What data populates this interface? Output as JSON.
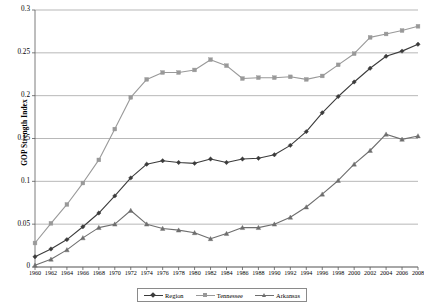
{
  "chart_data": {
    "type": "line",
    "title": "",
    "xlabel": "",
    "ylabel": "GOP Strength Index",
    "ylim": [
      0,
      0.3
    ],
    "ytick_labels": [
      "0",
      "0.05",
      "0.1",
      "0.15",
      "0.2",
      "0.25",
      "0.3"
    ],
    "ytick_values": [
      0,
      0.05,
      0.1,
      0.15,
      0.2,
      0.25,
      0.3
    ],
    "grid": true,
    "legend_position": "bottom",
    "categories": [
      1960,
      1962,
      1964,
      1966,
      1968,
      1970,
      1972,
      1974,
      1976,
      1978,
      1980,
      1982,
      1984,
      1986,
      1988,
      1990,
      1992,
      1994,
      1996,
      1998,
      2000,
      2002,
      2004,
      2006,
      2008
    ],
    "series": [
      {
        "name": "Region",
        "color": "#3b3b3b",
        "marker": "diamond",
        "values": [
          0.012,
          0.021,
          0.032,
          0.047,
          0.063,
          0.083,
          0.104,
          0.12,
          0.124,
          0.122,
          0.121,
          0.126,
          0.122,
          0.126,
          0.127,
          0.131,
          0.142,
          0.158,
          0.18,
          0.199,
          0.216,
          0.232,
          0.246,
          0.252,
          0.26
        ]
      },
      {
        "name": "Tennessee",
        "color": "#999999",
        "marker": "square",
        "values": [
          0.028,
          0.051,
          0.073,
          0.098,
          0.125,
          0.161,
          0.198,
          0.219,
          0.227,
          0.227,
          0.23,
          0.242,
          0.235,
          0.22,
          0.221,
          0.221,
          0.222,
          0.219,
          0.223,
          0.236,
          0.249,
          0.268,
          0.272,
          0.276,
          0.281
        ]
      },
      {
        "name": "Arkansas",
        "color": "#6e6e6e",
        "marker": "triangle",
        "values": [
          0.002,
          0.009,
          0.02,
          0.034,
          0.046,
          0.05,
          0.066,
          0.05,
          0.045,
          0.043,
          0.04,
          0.033,
          0.039,
          0.046,
          0.046,
          0.05,
          0.058,
          0.07,
          0.085,
          0.101,
          0.12,
          0.136,
          0.155,
          0.149,
          0.153
        ]
      }
    ]
  },
  "legend": {
    "items": [
      {
        "label": "Region"
      },
      {
        "label": "Tennessee"
      },
      {
        "label": "Arkansas"
      }
    ]
  }
}
